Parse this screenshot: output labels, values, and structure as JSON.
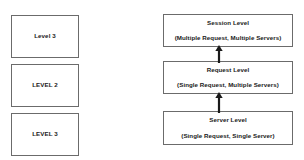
{
  "diagram": {
    "colors": {
      "background": "#ffffff",
      "box_border": "#6b6b6b",
      "box_fill": "#ffffff",
      "text": "#1a1a1a",
      "arrow": "#1a1a1a"
    },
    "left_column": {
      "name": "level-boxes",
      "boxes": [
        {
          "label": "Level 3"
        },
        {
          "label": "LEVEL 2"
        },
        {
          "label": "LEVEL 3"
        }
      ]
    },
    "right_column": {
      "name": "request-scope-boxes",
      "boxes": [
        {
          "title": "Session Level",
          "subtitle": "(Multiple Request, Multiple Servers)"
        },
        {
          "title": "Request Level",
          "subtitle": "(Single Request, Multiple Servers)"
        },
        {
          "title": "Server Level",
          "subtitle": "(Single Request, Single Server)"
        }
      ]
    },
    "connectors": [
      {
        "name": "request-to-session",
        "from": "Request Level",
        "to": "Session Level",
        "direction": "up",
        "style": "solid-arrow"
      },
      {
        "name": "server-to-request",
        "from": "Server Level",
        "to": "Request Level",
        "direction": "up",
        "style": "solid-arrow"
      }
    ]
  }
}
